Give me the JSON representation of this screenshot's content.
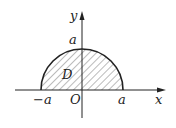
{
  "diagram": {
    "labels": {
      "y_axis": "y",
      "x_axis": "x",
      "top": "a",
      "region": "D",
      "left": "−a",
      "origin": "O",
      "right": "a"
    },
    "colors": {
      "stroke": "#222222",
      "hatch": "#555555",
      "background": "#ffffff"
    }
  }
}
